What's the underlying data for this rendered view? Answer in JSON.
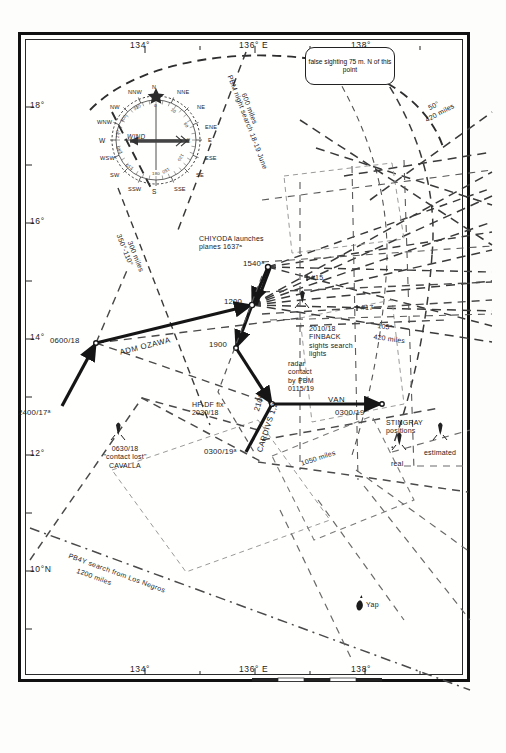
{
  "figure": {
    "kind": "historical-naval-chart",
    "theme": "Battle of the Philippine Sea — search and contact plot, 17-19 June 1944"
  },
  "axes": {
    "longitude_top": [
      "134°",
      "136° E",
      "138°"
    ],
    "longitude_bottom": [
      "134°",
      "136° E",
      "138°"
    ],
    "latitude_left": [
      "18°",
      "16°",
      "14°",
      "12°",
      "10°N"
    ]
  },
  "compass": {
    "name": "wind-rose",
    "wind_label": "WIND",
    "points": [
      "N",
      "NNE",
      "NE",
      "ENE",
      "E",
      "ESE",
      "SE",
      "SSE",
      "S",
      "SSW",
      "SW",
      "WSW",
      "W",
      "WNW",
      "NW",
      "NNW"
    ],
    "degrees": [
      "0",
      "30",
      "60",
      "90",
      "120",
      "150",
      "180",
      "210",
      "240",
      "270",
      "300",
      "330"
    ]
  },
  "callout": {
    "text": "false sighting\n75 m. N of\nthis point"
  },
  "labels": {
    "pbm_night_search": "PBM night search 18-19 June",
    "pbm_night_search_range": "600 miles",
    "search_350_110": "350°-110°",
    "search_350_110_range": "300 miles",
    "search_50": "50°",
    "search_50_range": "420 miles",
    "search_105": "105°",
    "search_105_range": "420 miles",
    "pb4y_search": "PB4Y search from Los Negros",
    "pb4y_range": "1200 miles",
    "range_1050": "1050 miles",
    "chiyoda": "CHIYODA launches\nplanes 1637ᵃ",
    "adm_ozawa": "ADM OZAWA",
    "cardivs": "CARDIVS 1,2",
    "van": "VAN",
    "hfdf": "HF-DF fix\n2030/18",
    "radar_contact": "radar\ncontact\nby PBM\n0115/19",
    "finback": "2010/18\nFINBACK\nsights search\nlights",
    "cavalla": "0630/18\n\"contact lost\"\nCAVALLA",
    "stingray": "STINGRAY\npositions",
    "stingray_real": "real",
    "stingray_estimated": "estimated",
    "yap": "Yap",
    "sub_15": "#15",
    "sub_17": "#17"
  },
  "track": {
    "name": "japanese-mobile-fleet-track",
    "fixes": [
      {
        "label": "2400/17ᵃ",
        "time": "2400/17"
      },
      {
        "label": "0600/18",
        "time": "0600/18"
      },
      {
        "label": "1200",
        "time": "1200"
      },
      {
        "label": "1540ᵃ",
        "time": "1540"
      },
      {
        "label": "1900",
        "time": "1900"
      },
      {
        "label": "2100",
        "time": "2100"
      },
      {
        "label": "0300/19ᵃ",
        "time": "0300/19"
      },
      {
        "label": "0300/19",
        "time": "0300/19"
      }
    ]
  },
  "colors": {
    "ink": "#1a1a1a",
    "track": "#151515",
    "dash": "#3a3a3a",
    "paper": "#fdfdfb"
  }
}
